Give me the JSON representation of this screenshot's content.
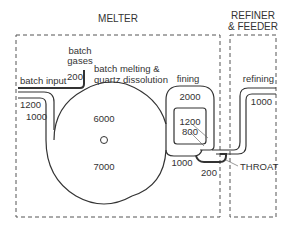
{
  "diagram": {
    "colors": {
      "line": "#333333",
      "dash": "#555555",
      "background": "#ffffff"
    },
    "sections": {
      "melter": {
        "title": "MELTER"
      },
      "refiner": {
        "title_line1": "REFINER",
        "title_line2": "& FEEDER"
      }
    },
    "labels": {
      "batch_gases_1": "batch",
      "batch_gases_2": "gases",
      "batch_gases_value": "200",
      "batch_input": "batch input",
      "batch_melting_1": "batch melting &",
      "batch_melting_2": "quartz dissolution",
      "fining": "fining",
      "refining": "refining",
      "throat": "THROAT"
    },
    "values": {
      "left_outer": "1200",
      "left_inner": "1000",
      "circle_top": "6000",
      "circle_bottom": "7000",
      "fining_outer": "2000",
      "fining_inner_1": "1200",
      "fining_inner_2": "800",
      "fining_bottom": "1000",
      "throat_value": "200",
      "refining_value": "1000"
    }
  }
}
